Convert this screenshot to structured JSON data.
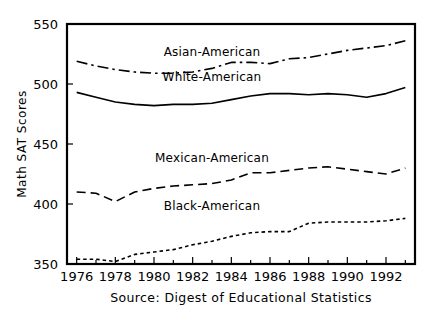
{
  "chart_data": {
    "type": "line",
    "title": "",
    "xlabel": "",
    "ylabel": "Math SAT Scores",
    "caption": "Source: Digest of Educational Statistics",
    "xlim": [
      1975.5,
      1993.5
    ],
    "ylim": [
      350,
      550
    ],
    "grid": false,
    "legend_position": "inline-labels",
    "y_ticks": [
      350,
      400,
      450,
      500,
      550
    ],
    "y_tick_labels": [
      "350",
      "400",
      "450",
      "500",
      "550"
    ],
    "x_ticks": [
      1976,
      1978,
      1980,
      1982,
      1984,
      1986,
      1988,
      1990,
      1992
    ],
    "x_tick_labels": [
      "1976",
      "1978",
      "1980",
      "1982",
      "1984",
      "1986",
      "1988",
      "1990",
      "1992"
    ],
    "x_minor_ticks": [
      1977,
      1979,
      1981,
      1983,
      1985,
      1987,
      1989,
      1991,
      1993
    ],
    "x": [
      1976,
      1977,
      1978,
      1979,
      1980,
      1981,
      1982,
      1983,
      1984,
      1985,
      1986,
      1987,
      1988,
      1989,
      1990,
      1991,
      1992,
      1993
    ],
    "series": [
      {
        "name": "Asian-American",
        "label": "Asian-American",
        "linestyle": "dashdot",
        "color": "#000000",
        "label_x": 1983.0,
        "label_y": 527,
        "values": [
          519,
          515,
          512,
          510,
          509,
          509,
          510,
          513,
          518,
          518,
          517,
          521,
          522,
          525,
          528,
          530,
          532,
          536
        ]
      },
      {
        "name": "White-American",
        "label": "White-American",
        "linestyle": "solid",
        "color": "#000000",
        "label_x": 1983.0,
        "label_y": 506,
        "values": [
          493,
          489,
          485,
          483,
          482,
          483,
          483,
          484,
          487,
          490,
          492,
          492,
          491,
          492,
          491,
          489,
          492,
          497
        ]
      },
      {
        "name": "Mexican-American",
        "label": "Mexican-American",
        "linestyle": "dashed",
        "color": "#000000",
        "label_x": 1983.0,
        "label_y": 438,
        "values": [
          410,
          409,
          402,
          410,
          413,
          415,
          416,
          417,
          420,
          426,
          426,
          428,
          430,
          431,
          429,
          427,
          425,
          430
        ]
      },
      {
        "name": "Black-American",
        "label": "Black-American",
        "linestyle": "dotted",
        "color": "#000000",
        "label_x": 1983.0,
        "label_y": 398,
        "values": [
          354,
          354,
          352,
          358,
          360,
          362,
          366,
          369,
          373,
          376,
          377,
          377,
          384,
          385,
          385,
          385,
          386,
          388
        ]
      }
    ]
  },
  "plot": {
    "left_px": 67,
    "right_px": 415,
    "top_px": 24,
    "bottom_px": 264
  }
}
